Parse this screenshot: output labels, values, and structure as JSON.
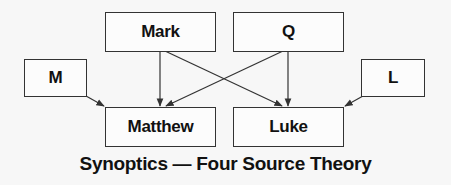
{
  "diagram": {
    "title": "Synoptics — Four Source Theory",
    "nodes": {
      "mark": "Mark",
      "q": "Q",
      "m": "M",
      "l": "L",
      "matthew": "Matthew",
      "luke": "Luke"
    },
    "edges": [
      {
        "from": "Mark",
        "to": "Matthew"
      },
      {
        "from": "Mark",
        "to": "Luke"
      },
      {
        "from": "Q",
        "to": "Matthew"
      },
      {
        "from": "Q",
        "to": "Luke"
      },
      {
        "from": "M",
        "to": "Matthew"
      },
      {
        "from": "L",
        "to": "Luke"
      }
    ],
    "colors": {
      "line": "#333333",
      "text": "#111111",
      "background": "#f7f7f7"
    }
  }
}
